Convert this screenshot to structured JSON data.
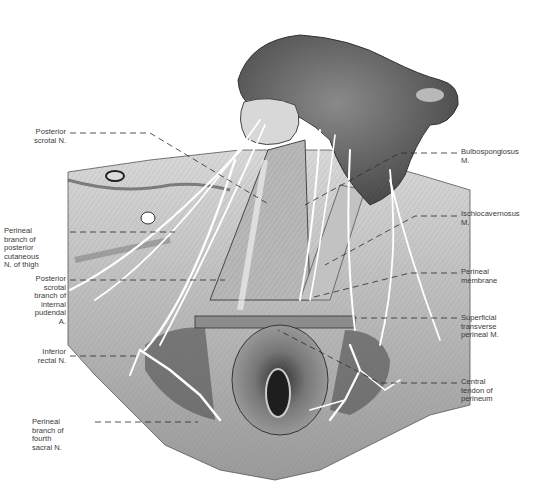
{
  "figure": {
    "labels_left": [
      {
        "id": "posterior-scrotal-n",
        "text": "Posterior\nscrotal N.",
        "x": 4,
        "y": 130,
        "w": 62
      },
      {
        "id": "perineal-branch-posterior-cutaneous",
        "text": "Perineal\nbranch of\nposterior\ncutaneous\nN. of thigh",
        "x": 4,
        "y": 227,
        "w": 66
      },
      {
        "id": "posterior-scrotal-branch-internal-pudendal",
        "text": "Posterior\nscrotal\nbranch of\ninternal\npudendal\nA.",
        "x": 4,
        "y": 275,
        "w": 62
      },
      {
        "id": "inferior-rectal-n",
        "text": "Inferior\nrectal N.",
        "x": 4,
        "y": 348,
        "w": 62
      },
      {
        "id": "perineal-branch-fourth-sacral",
        "text": "Perineal\nbranch of\nfourth\nsacral N.",
        "x": 32,
        "y": 419,
        "w": 60
      }
    ],
    "labels_right": [
      {
        "id": "bulbospongiosus-m",
        "text": "Bulbospongiosus\nM.",
        "x": 461,
        "y": 148
      },
      {
        "id": "ischiocavernosus-m",
        "text": "Ischiocavernosus\nM.",
        "x": 461,
        "y": 210
      },
      {
        "id": "perineal-membrane",
        "text": "Perineal\nmembrane",
        "x": 461,
        "y": 268
      },
      {
        "id": "superficial-transverse-perineal-m",
        "text": "Superficial\ntransverse\nperineal M.",
        "x": 461,
        "y": 314
      },
      {
        "id": "central-tendon-perineum",
        "text": "Central\ntendon of\nperineum",
        "x": 461,
        "y": 378
      }
    ],
    "leader_lines": [
      {
        "for": "posterior-scrotal-n",
        "x1": 70,
        "y1": 133,
        "x2": 150,
        "y2": 133,
        "x3": 270,
        "y3": 205
      },
      {
        "for": "perineal-branch-posterior-cutaneous",
        "x1": 70,
        "y1": 232,
        "x2": 175,
        "y2": 232
      },
      {
        "for": "posterior-scrotal-branch-internal-pudendal",
        "x1": 70,
        "y1": 280,
        "x2": 225,
        "y2": 280
      },
      {
        "for": "inferior-rectal-n",
        "x1": 70,
        "y1": 356,
        "x2": 140,
        "y2": 356
      },
      {
        "for": "perineal-branch-fourth-sacral",
        "x1": 70,
        "y1": 422,
        "x2": 198,
        "y2": 422
      },
      {
        "for": "bulbospongiosus-m",
        "x1": 457,
        "y1": 153,
        "x2": 400,
        "y2": 153,
        "x3": 305,
        "y3": 205
      },
      {
        "for": "ischiocavernosus-m",
        "x1": 457,
        "y1": 216,
        "x2": 415,
        "y2": 216,
        "x3": 325,
        "y3": 265
      },
      {
        "for": "perineal-membrane",
        "x1": 457,
        "y1": 273,
        "x2": 410,
        "y2": 273,
        "x3": 310,
        "y3": 298
      },
      {
        "for": "superficial-transverse-perineal-m",
        "x1": 457,
        "y1": 318,
        "x2": 355,
        "y2": 318
      },
      {
        "for": "central-tendon-perineum",
        "x1": 457,
        "y1": 383,
        "x2": 380,
        "y2": 383,
        "x3": 278,
        "y3": 330
      }
    ]
  }
}
